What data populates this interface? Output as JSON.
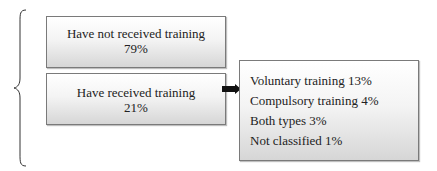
{
  "diagram": {
    "not_received": {
      "label": "Have not received training",
      "percent": "79%"
    },
    "received": {
      "label": "Have received training",
      "percent": "21%"
    },
    "breakdown": [
      {
        "text": "Voluntary training 13%"
      },
      {
        "text": "Compulsory training 4%"
      },
      {
        "text": "Both types 3%"
      },
      {
        "text": "Not classified 1%"
      }
    ],
    "icons": {
      "brace": "curly-brace-left",
      "arrow": "arrow-right"
    }
  }
}
